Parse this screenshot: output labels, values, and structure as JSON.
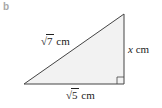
{
  "part_label": "b",
  "triangle": {
    "vertices": {
      "bottom_left": [
        24,
        84
      ],
      "bottom_right": [
        124,
        84
      ],
      "top_right": [
        124,
        14
      ]
    },
    "fill": "#f2f2f2",
    "stroke": "#444444",
    "right_angle_at": "bottom_right"
  },
  "labels": {
    "hypotenuse": {
      "radicand": "7",
      "unit": "cm"
    },
    "vertical": {
      "var": "x",
      "unit": "cm"
    },
    "base": {
      "radicand": "5",
      "unit": "cm"
    }
  }
}
